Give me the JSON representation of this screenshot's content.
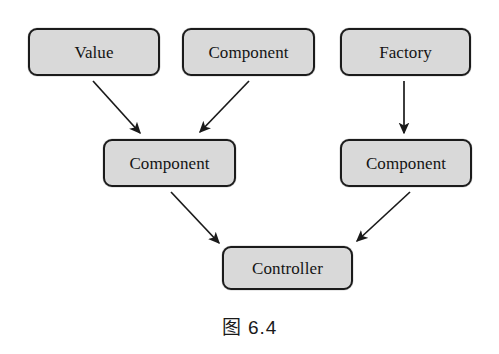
{
  "figure": {
    "caption": "图 6.4",
    "caption_x": 0,
    "caption_y": 312,
    "background_color": "#ffffff"
  },
  "style": {
    "node_fill": "#d9d9d9",
    "node_border": "#1b1b1b",
    "arrow_color": "#1a1a1a",
    "text_color": "#141414"
  },
  "diagram": {
    "type": "flow-diagram",
    "nodes": [
      {
        "id": "value",
        "label": "Value",
        "x": 28,
        "y": 28,
        "w": 132,
        "h": 48
      },
      {
        "id": "component-top",
        "label": "Component",
        "x": 182,
        "y": 28,
        "w": 133,
        "h": 48
      },
      {
        "id": "factory",
        "label": "Factory",
        "x": 340,
        "y": 28,
        "w": 131,
        "h": 48
      },
      {
        "id": "component-mid-left",
        "label": "Component",
        "x": 103,
        "y": 139,
        "w": 133,
        "h": 48
      },
      {
        "id": "component-mid-right",
        "label": "Component",
        "x": 340,
        "y": 139,
        "w": 132,
        "h": 48
      },
      {
        "id": "controller",
        "label": "Controller",
        "x": 222,
        "y": 246,
        "w": 131,
        "h": 44
      }
    ],
    "edges": [
      {
        "id": "value-to-component",
        "from": "value",
        "to": "component-mid-left",
        "x1": 93,
        "y1": 81,
        "x2": 140,
        "y2": 133
      },
      {
        "id": "component-top-to-component",
        "from": "component-top",
        "to": "component-mid-left",
        "x1": 249,
        "y1": 81,
        "x2": 200,
        "y2": 132
      },
      {
        "id": "factory-to-component",
        "from": "factory",
        "to": "component-mid-right",
        "x1": 404,
        "y1": 81,
        "x2": 404,
        "y2": 133
      },
      {
        "id": "component-left-to-controller",
        "from": "component-mid-left",
        "to": "controller",
        "x1": 171,
        "y1": 192,
        "x2": 219,
        "y2": 243
      },
      {
        "id": "component-right-to-controller",
        "from": "component-mid-right",
        "to": "controller",
        "x1": 410,
        "y1": 192,
        "x2": 357,
        "y2": 241
      }
    ]
  }
}
